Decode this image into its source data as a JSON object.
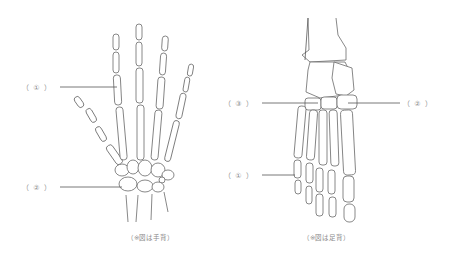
{
  "hand": {
    "labels": [
      {
        "id": "hand-1",
        "text": "（ ① ）"
      },
      {
        "id": "hand-2",
        "text": "（ ② ）"
      }
    ],
    "caption": "（※図は手背）"
  },
  "foot": {
    "labels": [
      {
        "id": "foot-3",
        "text": "（ ③ ）"
      },
      {
        "id": "foot-2",
        "text": "（ ② ）"
      },
      {
        "id": "foot-1",
        "text": "（ ① ）"
      }
    ],
    "caption": "（※図は足背）"
  }
}
